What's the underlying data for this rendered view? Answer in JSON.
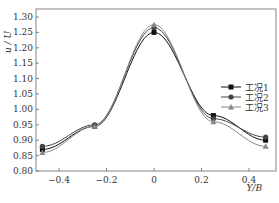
{
  "chart_data": {
    "type": "line",
    "title": "",
    "xlabel": "Y/B",
    "ylabel": "u/U",
    "xlim": [
      -0.5,
      0.5
    ],
    "ylim": [
      0.8,
      1.3
    ],
    "grid": false,
    "legend_position": "right-middle",
    "x_ticks": [
      -0.4,
      -0.2,
      0,
      0.2,
      0.4
    ],
    "x_tick_labels": [
      "-0.4",
      "-0.2",
      "0",
      "0.2",
      "0.4"
    ],
    "y_ticks": [
      0.8,
      0.85,
      0.9,
      0.95,
      1.0,
      1.05,
      1.1,
      1.15,
      1.2,
      1.25,
      1.3
    ],
    "y_tick_labels": [
      "0.80",
      "0.85",
      "0.90",
      "0.95",
      "1.00",
      "1.05",
      "1.10",
      "1.15",
      "1.20",
      "1.25",
      "1.30"
    ],
    "x": [
      -0.47,
      -0.25,
      0,
      0.25,
      0.47
    ],
    "series": [
      {
        "name": "工况1",
        "marker": "square",
        "color": "#111111",
        "values": [
          0.87,
          0.945,
          1.25,
          0.98,
          0.9
        ]
      },
      {
        "name": "工况2",
        "marker": "circle",
        "color": "#444444",
        "values": [
          0.88,
          0.95,
          1.265,
          0.97,
          0.91
        ]
      },
      {
        "name": "工况3",
        "marker": "triangle",
        "color": "#888888",
        "values": [
          0.86,
          0.945,
          1.275,
          0.96,
          0.88
        ]
      }
    ]
  },
  "labels": {
    "ylabel": "u / U",
    "xlabel": "Y/B"
  }
}
